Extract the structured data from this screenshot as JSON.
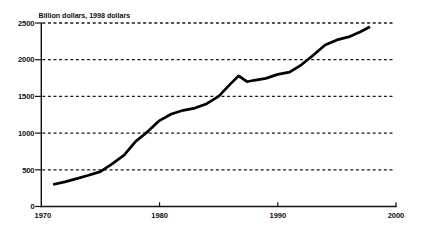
{
  "chart_data": {
    "type": "line",
    "title": "Billion dollars, 1998 dollars",
    "xlabel": "",
    "ylabel": "Billion dollars, 1998 dollars",
    "xlim": [
      1970,
      2000
    ],
    "ylim": [
      0,
      2500
    ],
    "x_ticks": [
      1970,
      1980,
      1990,
      2000
    ],
    "y_ticks": [
      0,
      500,
      1000,
      1500,
      2000,
      2500
    ],
    "gridlines_at": [
      500,
      1000,
      1500,
      2000,
      2500
    ],
    "grid_style": "dashed",
    "legend_position": "none",
    "line_color": "#000000",
    "grid_color": "#1a1a1a",
    "axis_color": "#111111",
    "background_color": "#ffffff",
    "series": [
      {
        "name": "real-dollars-line",
        "points": [
          [
            1971,
            300
          ],
          [
            1972,
            335
          ],
          [
            1973,
            380
          ],
          [
            1974,
            425
          ],
          [
            1975,
            475
          ],
          [
            1976,
            580
          ],
          [
            1977,
            700
          ],
          [
            1978,
            890
          ],
          [
            1979,
            1020
          ],
          [
            1980,
            1170
          ],
          [
            1981,
            1260
          ],
          [
            1982,
            1310
          ],
          [
            1983,
            1340
          ],
          [
            1984,
            1400
          ],
          [
            1985,
            1500
          ],
          [
            1986,
            1670
          ],
          [
            1986.7,
            1780
          ],
          [
            1987.4,
            1700
          ],
          [
            1988,
            1720
          ],
          [
            1989,
            1745
          ],
          [
            1990,
            1800
          ],
          [
            1991,
            1830
          ],
          [
            1992,
            1930
          ],
          [
            1993,
            2060
          ],
          [
            1994,
            2200
          ],
          [
            1995,
            2270
          ],
          [
            1996,
            2310
          ],
          [
            1997,
            2380
          ],
          [
            1997.8,
            2450
          ]
        ]
      }
    ]
  }
}
